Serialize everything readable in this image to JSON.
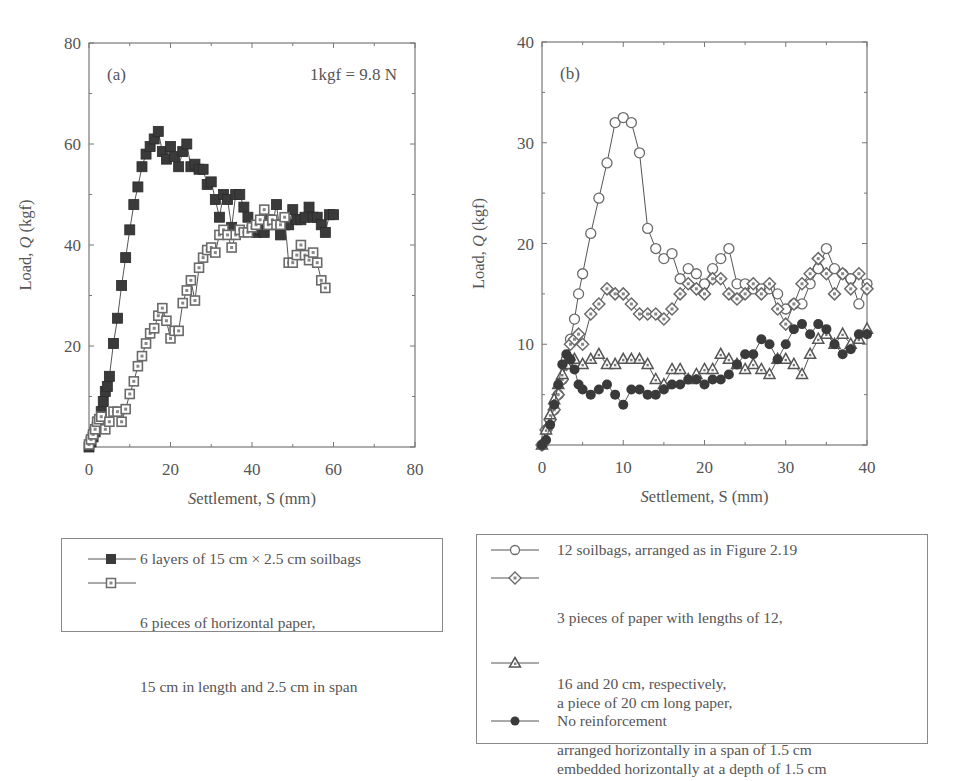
{
  "figure": {
    "panels": [
      "(a)",
      "(b)"
    ]
  },
  "chart_data": [
    {
      "type": "line",
      "panel_label": "(a)",
      "annotation": "1kgf = 9.8 N",
      "xlabel": "Settlement, S (mm)",
      "ylabel": "Load, Q (kgf)",
      "xlim": [
        0,
        80
      ],
      "ylim": [
        0,
        80
      ],
      "xticks": [
        0,
        20,
        40,
        60,
        80
      ],
      "yticks": [
        20,
        40,
        60,
        80
      ],
      "ytick_labels_shown": [
        "20",
        "40",
        "60",
        "80"
      ],
      "grid": false,
      "legend_position": "below",
      "series": [
        {
          "name": "6 layers of 15 cm × 2.5 cm soilbags",
          "marker": "filled-square",
          "x": [
            0,
            0.5,
            1,
            1.5,
            2,
            2.5,
            3,
            3.5,
            4,
            4.5,
            5,
            6,
            7,
            8,
            9,
            10,
            11,
            12,
            13,
            14,
            15,
            16,
            17,
            18,
            19,
            20,
            21,
            22,
            23,
            24,
            25,
            26,
            27,
            28,
            29,
            30,
            31,
            32,
            33,
            34,
            35,
            36,
            37,
            38,
            39,
            40,
            41,
            42,
            43,
            44,
            45,
            46,
            47,
            48,
            49,
            50,
            51,
            52,
            53,
            54,
            55,
            56,
            57,
            58,
            59,
            60
          ],
          "y": [
            0,
            1,
            2,
            3,
            4,
            5,
            7,
            9,
            11,
            12,
            14,
            20.5,
            25.5,
            32,
            37.5,
            43,
            48,
            51.5,
            55.5,
            58,
            59.5,
            61,
            62.5,
            58.5,
            57,
            59.5,
            57.5,
            55.5,
            58.5,
            60,
            55.5,
            56,
            55,
            55,
            52,
            52.5,
            49,
            45.5,
            50,
            49,
            43.5,
            50,
            50,
            47.5,
            45.5,
            43,
            42.5,
            43,
            42.5,
            45,
            44,
            48,
            42,
            44,
            44,
            47,
            45,
            45,
            45.5,
            47.5,
            45.5,
            45.5,
            44,
            42.5,
            46,
            46
          ]
        },
        {
          "name": "6 pieces of horizontal paper, 15 cm in length and 2.5 cm in span",
          "marker": "open-square-dot",
          "x": [
            0,
            0.5,
            1,
            1.5,
            2,
            2.5,
            3,
            4,
            5,
            6,
            7,
            8,
            9,
            10,
            11,
            12,
            13,
            14,
            15,
            16,
            17,
            18,
            19,
            20,
            21,
            22,
            23,
            24,
            25,
            26,
            27,
            28,
            29,
            30,
            31,
            32,
            33,
            34,
            35,
            36,
            37,
            38,
            39,
            40,
            41,
            42,
            43,
            44,
            45,
            46,
            47,
            48,
            49,
            50,
            51,
            52,
            53,
            54,
            55,
            56,
            57,
            58
          ],
          "y": [
            0.5,
            1.5,
            2.5,
            3.5,
            5,
            5.5,
            6,
            3.5,
            5,
            7,
            7,
            5,
            7.5,
            10.5,
            13,
            16,
            18,
            20.5,
            22.5,
            23.5,
            26,
            27.5,
            25,
            21.5,
            23,
            23,
            28.5,
            31,
            33,
            29,
            35.5,
            37.5,
            39,
            39.5,
            38.5,
            42,
            43,
            42,
            39.5,
            42,
            43,
            42.5,
            42.5,
            43.5,
            44,
            45,
            47,
            44,
            45,
            44,
            44,
            45.5,
            36.5,
            36.5,
            38,
            40,
            38,
            37,
            38.5,
            36.5,
            33,
            31.5
          ]
        }
      ]
    },
    {
      "type": "line",
      "panel_label": "(b)",
      "xlabel": "Settlement, S (mm)",
      "ylabel": "Load, Q (kgf)",
      "xlim": [
        0,
        40
      ],
      "ylim": [
        0,
        40
      ],
      "xticks": [
        0,
        10,
        20,
        30,
        40
      ],
      "yticks": [
        10,
        20,
        30,
        40
      ],
      "grid": false,
      "legend_position": "below",
      "series": [
        {
          "name": "12 soilbags, arranged as in Figure 2.19",
          "marker": "open-circle",
          "x": [
            0,
            0.5,
            1,
            1.5,
            2,
            2.5,
            3,
            3.5,
            4,
            4.5,
            5,
            6,
            7,
            8,
            9,
            10,
            11,
            12,
            13,
            14,
            15,
            16,
            17,
            18,
            19,
            20,
            21,
            22,
            23,
            24,
            25,
            26,
            27,
            28,
            29,
            30,
            31,
            32,
            33,
            34,
            35,
            36,
            37,
            38,
            39,
            40
          ],
          "y": [
            0,
            1.5,
            2.5,
            3.5,
            5,
            6.5,
            8.5,
            10.5,
            12.5,
            15,
            17,
            21,
            24.5,
            28,
            32,
            32.5,
            32,
            29,
            21.5,
            19.5,
            18.5,
            19,
            16.5,
            17.5,
            17,
            16,
            17.5,
            18.5,
            19.5,
            16,
            16,
            15.5,
            15.5,
            15.5,
            15,
            13.5,
            14,
            14,
            16,
            17.5,
            19.5,
            17.5,
            17,
            16.5,
            14,
            16
          ]
        },
        {
          "name": "3 pieces of paper with lengths of 12, 16 and 20 cm, respectively, arranged horizontally in a span of 1.5 cm",
          "marker": "open-diamond-dot",
          "x": [
            0,
            0.5,
            1,
            1.5,
            2,
            2.5,
            3,
            3.5,
            4,
            4.5,
            5,
            6,
            7,
            8,
            9,
            10,
            11,
            12,
            13,
            14,
            15,
            16,
            17,
            18,
            19,
            20,
            21,
            22,
            23,
            24,
            25,
            26,
            27,
            28,
            29,
            30,
            31,
            32,
            33,
            34,
            35,
            36,
            37,
            38,
            39,
            40
          ],
          "y": [
            0,
            1.5,
            2.5,
            3.5,
            5,
            6.5,
            8,
            10,
            10.5,
            11,
            10,
            13,
            14,
            15.5,
            15,
            15,
            14,
            13,
            13,
            13,
            12.5,
            13.5,
            15,
            16,
            15.5,
            15,
            16.5,
            16.5,
            15,
            14.5,
            15,
            16,
            15,
            16,
            13.5,
            12,
            14,
            16,
            17,
            18.5,
            17,
            15,
            17,
            15.5,
            17,
            15.5
          ]
        },
        {
          "name": "a piece of 20 cm long paper, embedded horizontally at a depth of 1.5 cm",
          "marker": "open-triangle-dot",
          "x": [
            0,
            0.5,
            1,
            1.5,
            2,
            2.5,
            3,
            3.5,
            4,
            5,
            6,
            7,
            8,
            9,
            10,
            11,
            12,
            13,
            14,
            15,
            16,
            17,
            18,
            19,
            20,
            21,
            22,
            23,
            24,
            25,
            26,
            27,
            28,
            29,
            30,
            31,
            32,
            33,
            34,
            35,
            36,
            37,
            38,
            39,
            40
          ],
          "y": [
            0,
            1.5,
            3,
            4.5,
            6,
            7,
            8,
            8.5,
            8.5,
            8,
            8.5,
            9,
            8,
            8,
            8.5,
            8.5,
            8.5,
            8,
            6.5,
            6,
            7.5,
            7.5,
            6.5,
            7,
            7.5,
            7.5,
            9,
            8.5,
            8,
            7.5,
            8,
            7.5,
            7,
            8.5,
            8.5,
            8,
            7,
            9,
            10.5,
            11,
            10,
            11,
            10,
            10.5,
            11.5
          ]
        },
        {
          "name": "No reinforcement",
          "marker": "filled-circle",
          "x": [
            0,
            0.5,
            1,
            1.5,
            2,
            2.5,
            3,
            3.5,
            4,
            4.5,
            5,
            6,
            7,
            8,
            9,
            10,
            11,
            12,
            13,
            14,
            15,
            16,
            17,
            18,
            19,
            20,
            21,
            22,
            23,
            24,
            25,
            26,
            27,
            28,
            29,
            30,
            31,
            32,
            33,
            34,
            35,
            36,
            37,
            38,
            39,
            40
          ],
          "y": [
            0,
            0.5,
            2,
            4,
            6,
            8,
            9,
            8.5,
            7.5,
            6,
            5.5,
            5,
            5.5,
            6,
            5,
            4,
            5.5,
            5.5,
            5,
            5,
            5.5,
            6,
            6,
            6.5,
            6.5,
            6,
            6.5,
            6.5,
            7,
            8,
            9,
            9,
            10.5,
            10,
            8.5,
            10,
            11.5,
            12,
            11,
            12,
            11.5,
            10,
            9,
            9.5,
            11,
            11
          ]
        }
      ]
    }
  ],
  "legends": {
    "a": [
      {
        "lines": [
          "6 layers of 15 cm × 2.5 cm soilbags"
        ],
        "marker": "filled-square"
      },
      {
        "lines": [
          "6 pieces of horizontal paper,",
          "15 cm in length and 2.5 cm in span"
        ],
        "marker": "open-square-dot"
      }
    ],
    "b": [
      {
        "lines": [
          "12 soilbags, arranged as in Figure 2.19"
        ],
        "marker": "open-circle"
      },
      {
        "lines": [
          "3 pieces of paper with lengths of 12,",
          "16 and 20 cm, respectively,",
          "arranged horizontally in a span of 1.5 cm"
        ],
        "marker": "open-diamond-dot"
      },
      {
        "lines": [
          "a piece of 20 cm long paper,",
          "embedded horizontally at a depth of 1.5 cm"
        ],
        "marker": "open-triangle-dot"
      },
      {
        "lines": [
          "No reinforcement"
        ],
        "marker": "filled-circle"
      }
    ]
  },
  "colors": {
    "axis": "#777777",
    "text": "#555555",
    "filled": "#3a3a3a",
    "open_stroke": "#6a6a6a",
    "line": "#555555"
  }
}
